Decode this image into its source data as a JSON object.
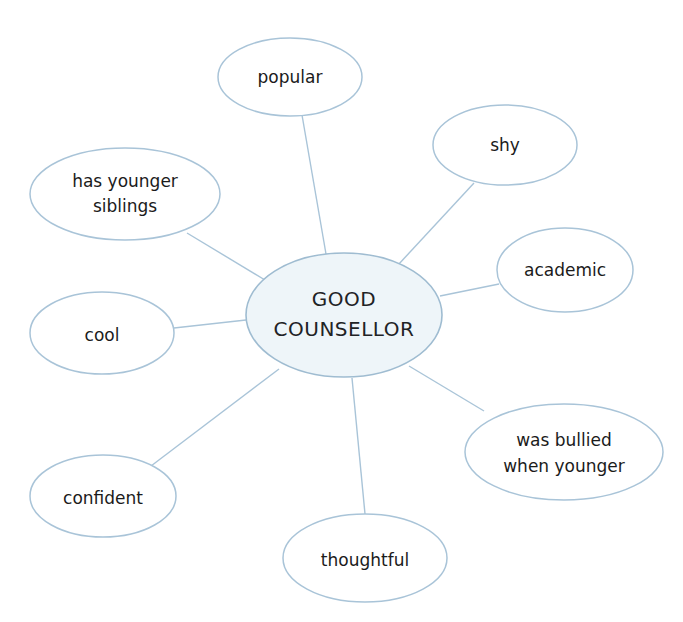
{
  "diagram": {
    "type": "mind-map",
    "colors": {
      "line": "#a9c4d8",
      "center_fill": "#eef5f9",
      "node_fill": "#ffffff",
      "text": "#1b1b1b"
    },
    "center": {
      "id": "good-counsellor",
      "lines": [
        "GOOD",
        "COUNSELLOR"
      ]
    },
    "nodes": [
      {
        "id": "popular",
        "lines": [
          "popular"
        ]
      },
      {
        "id": "shy",
        "lines": [
          "shy"
        ]
      },
      {
        "id": "has-younger-siblings",
        "lines": [
          "has younger",
          "siblings"
        ]
      },
      {
        "id": "academic",
        "lines": [
          "academic"
        ]
      },
      {
        "id": "cool",
        "lines": [
          "cool"
        ]
      },
      {
        "id": "was-bullied-when-younger",
        "lines": [
          "was bullied",
          "when younger"
        ]
      },
      {
        "id": "confident",
        "lines": [
          "confident"
        ]
      },
      {
        "id": "thoughtful",
        "lines": [
          "thoughtful"
        ]
      }
    ]
  }
}
